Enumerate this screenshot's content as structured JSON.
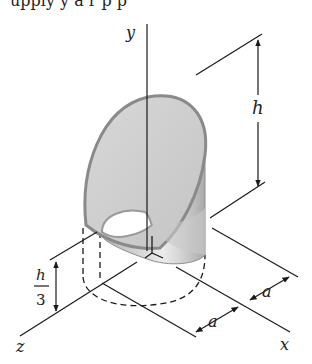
{
  "top_text_fragment": "upply y  a    r p  p",
  "axes": {
    "x_label": "x",
    "y_label": "y",
    "z_label": "z"
  },
  "dimensions": {
    "height_label": "h",
    "base_offset_numerator": "h",
    "base_offset_denominator": "3",
    "a_label_1": "a",
    "a_label_2": "a"
  },
  "colors": {
    "line": "#1a1a1a",
    "shell_light": "#e6e6e6",
    "shell_mid": "#c8c8c8",
    "shell_dark": "#9a9a9a",
    "rim": "#8c8c8c"
  }
}
